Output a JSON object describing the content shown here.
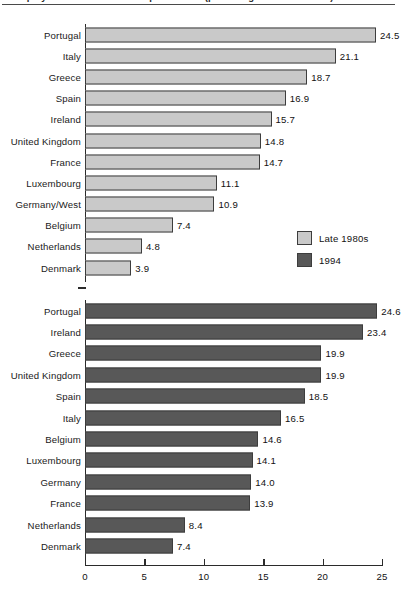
{
  "figure": {
    "title": "Unemployment rates in the European Union (percentage of labour force)",
    "axis_max": 25,
    "colors": {
      "late1980s": "#c9c9c9",
      "y1994": "#585858",
      "outline": "#3d3d3d",
      "axis": "#2b2b2b",
      "background": "#ffffff"
    }
  },
  "legend": {
    "position": "middle-right",
    "entries": [
      {
        "label": "Late 1980s",
        "swatch": "light"
      },
      {
        "label": "1994",
        "swatch": "dark"
      }
    ]
  },
  "xaxis": {
    "ticks": [
      0,
      5,
      10,
      15,
      20,
      25
    ],
    "tick_labels": [
      "0",
      "5",
      "10",
      "15",
      "20",
      "25"
    ],
    "min": 0,
    "max": 25
  },
  "chart_data": {
    "type": "bar",
    "orientation": "horizontal",
    "title": "Unemployment rates in the European Union (percentage of labour force)",
    "xlabel": "",
    "ylabel": "",
    "xlim": [
      0,
      25
    ],
    "grid": false,
    "legend_position": "middle-right",
    "panels": [
      {
        "name": "Late 1980s",
        "series_name": "Late 1980s",
        "color": "#c9c9c9",
        "categories": [
          "Portugal",
          "Italy",
          "Greece",
          "Spain",
          "Ireland",
          "United Kingdom",
          "France",
          "Luxembourg",
          "Germany/West",
          "Belgium",
          "Netherlands",
          "Denmark"
        ],
        "values": [
          24.5,
          21.1,
          18.7,
          16.9,
          15.7,
          14.8,
          14.7,
          11.1,
          10.9,
          7.4,
          4.8,
          3.9
        ],
        "value_labels": [
          "24.5",
          "21.1",
          "18.7",
          "16.9",
          "15.7",
          "14.8",
          "14.7",
          "11.1",
          "10.9",
          "7.4",
          "4.8",
          "3.9"
        ]
      },
      {
        "name": "1994",
        "series_name": "1994",
        "color": "#585858",
        "categories": [
          "Portugal",
          "Ireland",
          "Greece",
          "United Kingdom",
          "Spain",
          "Italy",
          "Belgium",
          "Luxembourg",
          "Germany",
          "France",
          "Netherlands",
          "Denmark"
        ],
        "values": [
          24.6,
          23.4,
          19.9,
          19.9,
          18.5,
          16.5,
          14.6,
          14.1,
          14.0,
          13.9,
          8.4,
          7.4
        ],
        "value_labels": [
          "24.6",
          "23.4",
          "19.9",
          "19.9",
          "18.5",
          "16.5",
          "14.6",
          "14.1",
          "14.0",
          "13.9",
          "8.4",
          "7.4"
        ]
      }
    ]
  }
}
